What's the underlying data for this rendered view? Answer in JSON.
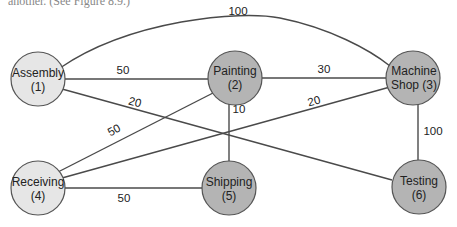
{
  "caption": "another. (See Figure 8.9.)",
  "colors": {
    "light_node": "#e6e6e6",
    "dark_node": "#b4b4b4",
    "edge": "#4a4a4a"
  },
  "nodes": [
    {
      "id": 1,
      "name": "Assembly",
      "line1": "Assembly",
      "line2": "(1)",
      "shade": "light"
    },
    {
      "id": 2,
      "name": "Painting",
      "line1": "Painting",
      "line2": "(2)",
      "shade": "dark"
    },
    {
      "id": 3,
      "name": "Machine Shop",
      "line1": "Machine",
      "line2": "Shop (3)",
      "shade": "dark"
    },
    {
      "id": 4,
      "name": "Receiving",
      "line1": "Receiving",
      "line2": "(4)",
      "shade": "light"
    },
    {
      "id": 5,
      "name": "Shipping",
      "line1": "Shipping",
      "line2": "(5)",
      "shade": "dark"
    },
    {
      "id": 6,
      "name": "Testing",
      "line1": "Testing",
      "line2": "(6)",
      "shade": "dark"
    }
  ],
  "edges": [
    {
      "from": 1,
      "to": 3,
      "weight": "100"
    },
    {
      "from": 1,
      "to": 2,
      "weight": "50"
    },
    {
      "from": 1,
      "to": 6,
      "weight": "20"
    },
    {
      "from": 2,
      "to": 3,
      "weight": "30"
    },
    {
      "from": 2,
      "to": 4,
      "weight": "50"
    },
    {
      "from": 2,
      "to": 5,
      "weight": "10"
    },
    {
      "from": 4,
      "to": 3,
      "weight": "20"
    },
    {
      "from": 3,
      "to": 6,
      "weight": "100"
    },
    {
      "from": 4,
      "to": 5,
      "weight": "50"
    }
  ]
}
